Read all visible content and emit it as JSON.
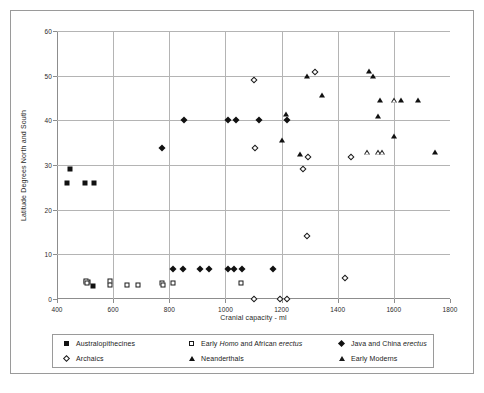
{
  "chart_data": {
    "type": "scatter",
    "title": "",
    "xlabel": "Cranial capacity - ml",
    "ylabel": "Latitude Degrees North and South",
    "xlim": [
      400,
      1800
    ],
    "ylim": [
      0,
      60
    ],
    "xticks": [
      400,
      600,
      800,
      1000,
      1200,
      1400,
      1600,
      1800
    ],
    "yticks": [
      0,
      10,
      20,
      30,
      40,
      50,
      60
    ],
    "grid": true,
    "legend_position": "bottom",
    "series": [
      {
        "name": "Australopithecines",
        "marker": "filled-square",
        "points": [
          [
            437,
            25.9
          ],
          [
            447,
            29.0
          ],
          [
            500,
            25.9
          ],
          [
            505,
            3.9
          ],
          [
            510,
            3.9
          ],
          [
            533,
            25.9
          ],
          [
            528,
            2.8
          ]
        ]
      },
      {
        "name": "Early Homo and African erectus",
        "marker": "open-square",
        "points": [
          [
            502,
            4.0
          ],
          [
            508,
            3.6
          ],
          [
            588,
            4.0
          ],
          [
            590,
            3.1
          ],
          [
            650,
            3.1
          ],
          [
            690,
            3.1
          ],
          [
            775,
            3.6
          ],
          [
            778,
            3.1
          ],
          [
            812,
            3.6
          ],
          [
            1055,
            3.6
          ]
        ]
      },
      {
        "name": "Java and China erectus",
        "marker": "filled-diamond",
        "points": [
          [
            775,
            33.8
          ],
          [
            813,
            6.8
          ],
          [
            850,
            6.8
          ],
          [
            852,
            40.1
          ],
          [
            908,
            6.8
          ],
          [
            940,
            6.8
          ],
          [
            1008,
            40.1
          ],
          [
            1010,
            6.8
          ],
          [
            1030,
            6.8
          ],
          [
            1038,
            40.1
          ],
          [
            1058,
            6.8
          ],
          [
            1120,
            40.1
          ],
          [
            1170,
            6.8
          ],
          [
            1218,
            40.1
          ]
        ]
      },
      {
        "name": "Archaics",
        "marker": "open-diamond",
        "points": [
          [
            1100,
            49.1
          ],
          [
            1105,
            33.8
          ],
          [
            1100,
            0.0
          ],
          [
            1195,
            0.0
          ],
          [
            1220,
            0.0
          ],
          [
            1275,
            29.2
          ],
          [
            1290,
            14.2
          ],
          [
            1295,
            31.8
          ],
          [
            1320,
            50.9
          ],
          [
            1425,
            4.6
          ],
          [
            1447,
            31.7
          ]
        ]
      },
      {
        "name": "Neanderthals",
        "marker": "filled-triangle",
        "points": [
          [
            1200,
            35.7
          ],
          [
            1215,
            41.5
          ],
          [
            1265,
            32.5
          ],
          [
            1290,
            50.0
          ],
          [
            1345,
            45.7
          ],
          [
            1513,
            51.0
          ],
          [
            1525,
            50.0
          ],
          [
            1545,
            41.0
          ],
          [
            1552,
            44.5
          ],
          [
            1600,
            36.6
          ],
          [
            1625,
            44.5
          ],
          [
            1685,
            44.5
          ],
          [
            1745,
            32.8
          ]
        ]
      },
      {
        "name": "Early Moderns",
        "marker": "open-triangle",
        "points": [
          [
            1505,
            32.9
          ],
          [
            1545,
            32.9
          ],
          [
            1557,
            32.9
          ],
          [
            1600,
            44.5
          ]
        ]
      }
    ]
  },
  "legend": {
    "entries": [
      {
        "label_pre": "Australopithecines",
        "label_it": "",
        "label_post": "",
        "marker": "filled-square",
        "name": "australopithecines"
      },
      {
        "label_pre": "Early ",
        "label_it": "Homo",
        "label_post": " and African ",
        "label_it2": "erectus",
        "marker": "open-square",
        "name": "early-homo-african-erectus"
      },
      {
        "label_pre": "Java and China ",
        "label_it": "erectus",
        "label_post": "",
        "marker": "filled-diamond",
        "name": "java-china-erectus"
      },
      {
        "label_pre": "Archaics",
        "label_it": "",
        "label_post": "",
        "marker": "open-diamond",
        "name": "archaics"
      },
      {
        "label_pre": "Neanderthals",
        "label_it": "",
        "label_post": "",
        "marker": "filled-triangle",
        "name": "neanderthals"
      },
      {
        "label_pre": "Early Moderns",
        "label_it": "",
        "label_post": "",
        "marker": "open-triangle",
        "name": "early-moderns"
      }
    ]
  },
  "colors": {
    "marker": "#111111",
    "grid": "#b4b4b4",
    "axis": "#8d8d8d",
    "frame": "#9a9a9a",
    "background": "#ffffff"
  }
}
